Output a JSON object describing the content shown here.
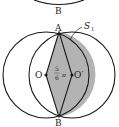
{
  "figure": {
    "top_label": "B",
    "points": {
      "A": "A",
      "B": "B",
      "O": "O",
      "O_prime": "O′"
    },
    "angle_label_num": "5",
    "angle_label_den": "6",
    "angle_label_pi": "π",
    "region_label": "S",
    "region_label_sub": "1",
    "colors": {
      "stroke": "#1a1a1a",
      "shade": "#b3b3b3",
      "background": "#ffffff"
    }
  }
}
